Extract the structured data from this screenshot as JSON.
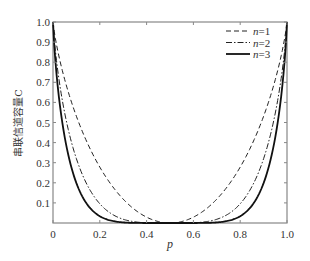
{
  "chart_data": {
    "type": "line",
    "title": "",
    "xlabel": "p",
    "ylabel": "串联信道容量C",
    "xlim": [
      0,
      1.0
    ],
    "ylim": [
      0,
      1.0
    ],
    "xticks": [
      "0",
      "0.2",
      "0.4",
      "0.6",
      "0.8",
      "1.0"
    ],
    "xtick_values": [
      0,
      0.2,
      0.4,
      0.6,
      0.8,
      1.0
    ],
    "yticks": [
      "0.1",
      "0.2",
      "0.3",
      "0.4",
      "0.5",
      "0.6",
      "0.7",
      "0.8",
      "0.9",
      "1.0"
    ],
    "ytick_values": [
      0.1,
      0.2,
      0.3,
      0.4,
      0.5,
      0.6,
      0.7,
      0.8,
      0.9,
      1.0
    ],
    "grid": false,
    "legend_position": "top-right",
    "x": [
      0,
      0.05,
      0.1,
      0.15,
      0.2,
      0.25,
      0.3,
      0.35,
      0.4,
      0.45,
      0.5,
      0.55,
      0.6,
      0.65,
      0.7,
      0.75,
      0.8,
      0.85,
      0.9,
      0.95,
      1.0
    ],
    "series": [
      {
        "name": "n=1",
        "label_var": "n",
        "label_value": "=1",
        "style": "dashed",
        "color": "#222222",
        "values": [
          1.0,
          0.714,
          0.531,
          0.39,
          0.278,
          0.189,
          0.119,
          0.066,
          0.029,
          0.007,
          0.0,
          0.007,
          0.029,
          0.066,
          0.119,
          0.189,
          0.278,
          0.39,
          0.531,
          0.714,
          1.0
        ]
      },
      {
        "name": "n=2",
        "label_var": "n",
        "label_value": "=2",
        "style": "dashdot",
        "color": "#222222",
        "values": [
          1.0,
          0.546,
          0.32,
          0.184,
          0.099,
          0.048,
          0.02,
          0.006,
          0.001,
          0.0,
          0.0,
          0.0,
          0.001,
          0.006,
          0.02,
          0.048,
          0.099,
          0.184,
          0.32,
          0.546,
          1.0
        ]
      },
      {
        "name": "n=3",
        "label_var": "n",
        "label_value": "=3",
        "style": "solid",
        "color": "#111111",
        "values": [
          1.0,
          0.434,
          0.203,
          0.092,
          0.037,
          0.012,
          0.003,
          0.0,
          0.0,
          0.0,
          0.0,
          0.0,
          0.0,
          0.0,
          0.003,
          0.012,
          0.037,
          0.092,
          0.203,
          0.434,
          1.0
        ]
      }
    ],
    "formula_note": "C = 1 - H((1-(1-2p)^n)/2)"
  }
}
